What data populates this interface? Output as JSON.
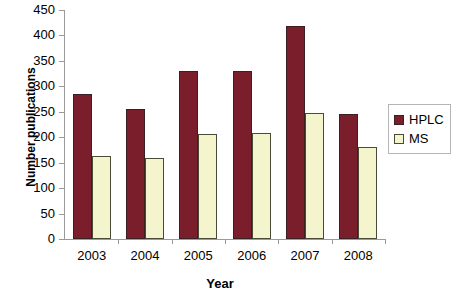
{
  "chart_data": {
    "type": "bar",
    "title": "",
    "xlabel": "Year",
    "ylabel": "Number publications",
    "categories": [
      "2003",
      "2004",
      "2005",
      "2006",
      "2007",
      "2008"
    ],
    "series": [
      {
        "name": "HPLC",
        "color": "#7b1e2b",
        "values": [
          284,
          256,
          330,
          331,
          419,
          246
        ]
      },
      {
        "name": "MS",
        "color": "#f4f4cd",
        "values": [
          163,
          159,
          206,
          209,
          247,
          181
        ]
      }
    ],
    "ylim": [
      0,
      450
    ],
    "ytick_step": 50,
    "yticks": [
      "450",
      "400",
      "350",
      "300",
      "250",
      "200",
      "150",
      "100",
      "50",
      "0"
    ],
    "grid": false,
    "legend_position": "right",
    "legend": [
      "HPLC",
      "MS"
    ]
  }
}
